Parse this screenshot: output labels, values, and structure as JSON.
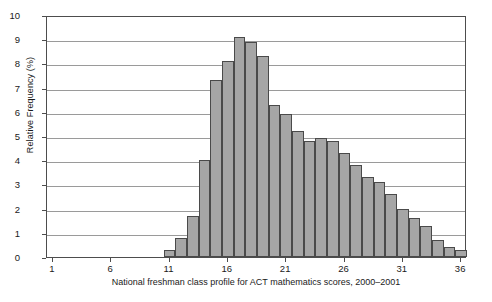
{
  "chart_data": {
    "type": "bar",
    "title": "",
    "xlabel": "National freshman class profile for ACT mathematics scores, 2000–2001",
    "ylabel": "Relative Frequency (%)",
    "xlim": [
      0.5,
      36.5
    ],
    "ylim": [
      0,
      10
    ],
    "grid": true,
    "legend": "none",
    "bar_color": "#a6a6a6",
    "bar_edge_color": "#4a4a4a",
    "grid_color": "#9a9a9a",
    "axis_color": "#4d4d4d",
    "x_tick_values": [
      1,
      6,
      11,
      16,
      21,
      26,
      31,
      36
    ],
    "x_tick_labels": [
      "1",
      "6",
      "11",
      "16",
      "21",
      "26",
      "31",
      "36"
    ],
    "y_tick_values": [
      0,
      1,
      2,
      3,
      4,
      5,
      6,
      7,
      8,
      9,
      10
    ],
    "y_tick_labels": [
      "0",
      "1",
      "2",
      "3",
      "4",
      "5",
      "6",
      "7",
      "8",
      "9",
      "10"
    ],
    "categories": [
      11,
      12,
      13,
      14,
      15,
      16,
      17,
      18,
      19,
      20,
      21,
      22,
      23,
      24,
      25,
      26,
      27,
      28,
      29,
      30,
      31,
      32,
      33,
      34,
      35,
      36
    ],
    "values": [
      0.3,
      0.8,
      1.7,
      4.0,
      7.3,
      8.1,
      9.1,
      8.9,
      8.3,
      6.3,
      5.9,
      5.2,
      4.8,
      4.9,
      4.8,
      4.3,
      3.8,
      3.3,
      3.1,
      2.6,
      2.0,
      1.6,
      1.3,
      0.7,
      0.4,
      0.3
    ]
  }
}
